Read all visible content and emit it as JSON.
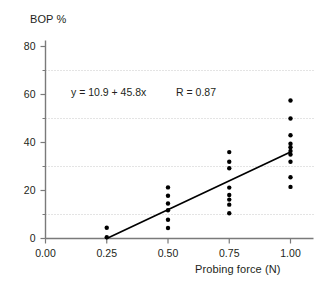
{
  "chart_data": {
    "type": "scatter",
    "title": "",
    "xlabel": "Probing force (N)",
    "ylabel": "BOP %",
    "xlim": [
      0.0,
      1.08
    ],
    "ylim": [
      0,
      82
    ],
    "xticks": [
      0.0,
      0.25,
      0.5,
      0.75,
      1.0
    ],
    "xtick_labels": [
      "0.00",
      "0.25",
      "0.50",
      "0.75",
      "1.00"
    ],
    "yticks": [
      0,
      20,
      40,
      60,
      80
    ],
    "ytick_labels": [
      "0",
      "20",
      "40",
      "60",
      "80"
    ],
    "y_minor_ticks": [
      10,
      30,
      50,
      70
    ],
    "gridlines": {
      "horizontal_dotted_at": [
        10,
        30,
        50,
        70
      ],
      "color": "#c9c9c9",
      "style": "dotted"
    },
    "marker": {
      "shape": "circle",
      "color": "#000000",
      "size_px": 4.4
    },
    "points": [
      {
        "x": 0.25,
        "y": 4.5
      },
      {
        "x": 0.25,
        "y": 0.5
      },
      {
        "x": 0.5,
        "y": 21.3
      },
      {
        "x": 0.5,
        "y": 17.8
      },
      {
        "x": 0.5,
        "y": 14.6
      },
      {
        "x": 0.5,
        "y": 11.8
      },
      {
        "x": 0.5,
        "y": 7.8
      },
      {
        "x": 0.5,
        "y": 4.4
      },
      {
        "x": 0.75,
        "y": 36.0
      },
      {
        "x": 0.75,
        "y": 32.0
      },
      {
        "x": 0.75,
        "y": 29.3
      },
      {
        "x": 0.75,
        "y": 21.2
      },
      {
        "x": 0.75,
        "y": 18.1
      },
      {
        "x": 0.75,
        "y": 16.2
      },
      {
        "x": 0.75,
        "y": 14.1
      },
      {
        "x": 0.75,
        "y": 10.5
      },
      {
        "x": 1.0,
        "y": 57.5
      },
      {
        "x": 1.0,
        "y": 50.0
      },
      {
        "x": 1.0,
        "y": 43.0
      },
      {
        "x": 1.0,
        "y": 39.5
      },
      {
        "x": 1.0,
        "y": 38.0
      },
      {
        "x": 1.0,
        "y": 36.5
      },
      {
        "x": 1.0,
        "y": 35.0
      },
      {
        "x": 1.0,
        "y": 32.0
      },
      {
        "x": 1.0,
        "y": 25.5
      },
      {
        "x": 1.0,
        "y": 21.5
      }
    ],
    "fit_line": {
      "equation_label": "y = 10.9 + 45.8x",
      "correlation_label": "R = 0.87",
      "intercept": 10.9,
      "slope": 45.8,
      "r": 0.87,
      "x_start": 0.25,
      "x_end": 1.0,
      "y_start": 0.0,
      "y_end": 36.0,
      "color": "#000000"
    },
    "legend": null,
    "grid": true
  },
  "axes": {
    "y_title": "BOP %",
    "x_title": "Probing force (N)",
    "axis_color": "#7a7a7a"
  }
}
